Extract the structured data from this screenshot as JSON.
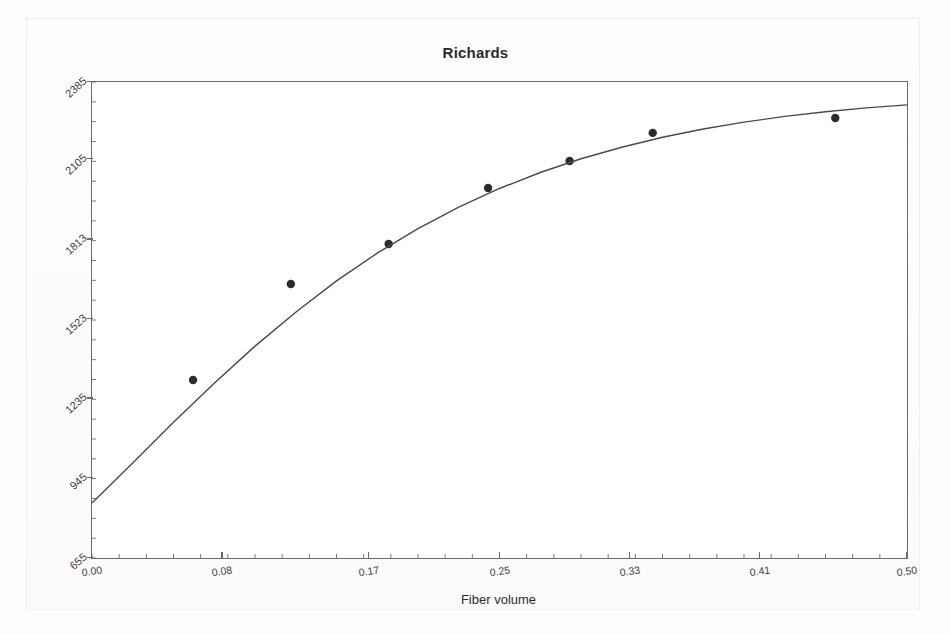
{
  "chart_data": {
    "type": "scatter",
    "title": "Richards",
    "xlabel": "Fiber volume",
    "ylabel": "Young's modulus (MPa)",
    "xlim": [
      0.0,
      0.5
    ],
    "ylim": [
      655,
      2385
    ],
    "xticks": [
      "0.00",
      "0.08",
      "0.17",
      "0.25",
      "0.33",
      "0.41",
      "0.50"
    ],
    "xtick_values": [
      0.0,
      0.08,
      0.17,
      0.25,
      0.33,
      0.41,
      0.5
    ],
    "yticks": [
      "2385",
      "2105",
      "1813",
      "1523",
      "1235",
      "945",
      "655"
    ],
    "ytick_values": [
      2385,
      2105,
      1813,
      1523,
      1235,
      945,
      655
    ],
    "grid": false,
    "legend": "none",
    "series": [
      {
        "name": "Observed data",
        "type": "scatter",
        "marker": "filled-circle",
        "color": "#2b2b2b",
        "x": [
          0.062,
          0.122,
          0.182,
          0.243,
          0.293,
          0.344,
          0.456
        ],
        "y": [
          1302,
          1651,
          1796,
          2000,
          2098,
          2200,
          2254
        ]
      },
      {
        "name": "Richards fitted curve",
        "type": "line",
        "color": "#4a4a4a",
        "x": [
          0.0,
          0.025,
          0.05,
          0.075,
          0.1,
          0.125,
          0.15,
          0.175,
          0.2,
          0.225,
          0.25,
          0.275,
          0.3,
          0.325,
          0.35,
          0.375,
          0.4,
          0.425,
          0.45,
          0.475,
          0.5
        ],
        "y": [
          855,
          1000,
          1148,
          1290,
          1425,
          1548,
          1662,
          1763,
          1852,
          1930,
          1998,
          2056,
          2106,
          2148,
          2184,
          2214,
          2239,
          2260,
          2277,
          2291,
          2302
        ]
      }
    ]
  },
  "figure": {
    "title": "Richards",
    "background_color": "#fdfdfd",
    "plot_background_color": "#ffffff",
    "axis_color": "#6b6b6b",
    "marker_color": "#2b2b2b",
    "curve_color": "#4a4a4a"
  }
}
